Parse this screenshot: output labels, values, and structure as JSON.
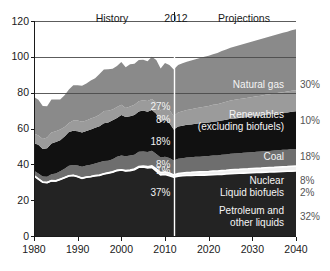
{
  "chart_data": {
    "type": "area",
    "title": "",
    "xlabel": "",
    "ylabel": "",
    "xlim": [
      1980,
      2040
    ],
    "ylim": [
      0,
      120
    ],
    "yticks": [
      0,
      20,
      40,
      60,
      80,
      100,
      120
    ],
    "xticks": [
      1980,
      1990,
      2000,
      2010,
      2020,
      2030,
      2040
    ],
    "grid": false,
    "legend_position": "inline-right",
    "stacked": true,
    "annotations": {
      "history_label": "History",
      "divider_year_label": "2012",
      "projections_label": "Projections",
      "divider_year": 2012
    },
    "x": [
      1980,
      1981,
      1982,
      1983,
      1984,
      1985,
      1986,
      1987,
      1988,
      1989,
      1990,
      1991,
      1992,
      1993,
      1994,
      1995,
      1996,
      1997,
      1998,
      1999,
      2000,
      2001,
      2002,
      2003,
      2004,
      2005,
      2006,
      2007,
      2008,
      2009,
      2010,
      2011,
      2012,
      2013,
      2014,
      2015,
      2016,
      2017,
      2018,
      2019,
      2020,
      2021,
      2022,
      2023,
      2024,
      2025,
      2026,
      2027,
      2028,
      2029,
      2030,
      2031,
      2032,
      2033,
      2034,
      2035,
      2036,
      2037,
      2038,
      2039,
      2040
    ],
    "series": [
      {
        "name": "Petroleum and other liquids",
        "color": "#232323",
        "label_2012": "37%",
        "label_2040": "32%",
        "values": [
          33.6,
          31.8,
          30.0,
          29.8,
          30.8,
          30.7,
          31.6,
          32.5,
          33.5,
          33.8,
          33.1,
          32.2,
          32.8,
          33.1,
          33.6,
          33.8,
          34.6,
          35.1,
          35.6,
          36.5,
          36.8,
          36.3,
          36.5,
          37.0,
          38.4,
          38.5,
          38.0,
          38.3,
          36.2,
          34.1,
          34.3,
          33.6,
          32.8,
          33.4,
          33.6,
          33.8,
          33.8,
          33.9,
          34.0,
          34.0,
          34.1,
          34.2,
          34.3,
          34.4,
          34.6,
          34.8,
          34.9,
          35.0,
          35.1,
          35.2,
          35.3,
          35.4,
          35.5,
          35.6,
          35.7,
          35.8,
          35.9,
          36.0,
          36.1,
          36.2,
          36.3
        ]
      },
      {
        "name": "Liquid biofuels",
        "color": "#f0f0f0",
        "label_2012": "1%",
        "label_2040": "2%",
        "values": [
          0.1,
          0.1,
          0.1,
          0.1,
          0.1,
          0.1,
          0.1,
          0.1,
          0.1,
          0.1,
          0.1,
          0.1,
          0.1,
          0.1,
          0.1,
          0.2,
          0.1,
          0.2,
          0.2,
          0.2,
          0.2,
          0.2,
          0.3,
          0.4,
          0.4,
          0.5,
          0.7,
          0.9,
          1.2,
          1.3,
          1.5,
          1.6,
          1.2,
          1.4,
          1.5,
          1.6,
          1.7,
          1.8,
          1.8,
          1.9,
          1.9,
          2.0,
          2.0,
          2.1,
          2.1,
          2.2,
          2.2,
          2.2,
          2.3,
          2.3,
          2.4,
          2.4,
          2.4,
          2.5,
          2.5,
          2.5,
          2.6,
          2.6,
          2.6,
          2.7,
          2.7
        ]
      },
      {
        "name": "Nuclear",
        "color": "#6e6e6e",
        "label_2012": "8%",
        "label_2040": "8%",
        "values": [
          2.7,
          3.0,
          3.1,
          3.2,
          3.6,
          4.1,
          4.4,
          4.9,
          5.6,
          5.7,
          6.1,
          6.4,
          6.5,
          6.5,
          6.8,
          7.1,
          7.2,
          6.7,
          7.1,
          7.6,
          7.9,
          8.0,
          8.1,
          7.9,
          8.2,
          8.2,
          8.2,
          8.4,
          8.4,
          8.4,
          8.4,
          8.3,
          8.1,
          8.3,
          8.3,
          8.4,
          8.4,
          8.5,
          8.5,
          8.6,
          8.6,
          8.7,
          8.7,
          8.8,
          8.8,
          8.9,
          8.9,
          9.0,
          9.0,
          9.1,
          9.1,
          9.2,
          9.2,
          9.3,
          9.3,
          9.4,
          9.4,
          9.5,
          9.5,
          9.6,
          9.6
        ]
      },
      {
        "name": "Coal",
        "color": "#111111",
        "label_2012": "18%",
        "label_2040": "18%",
        "values": [
          15.4,
          16.0,
          15.3,
          15.9,
          17.1,
          17.5,
          17.3,
          18.0,
          18.8,
          19.1,
          19.2,
          19.0,
          19.2,
          19.8,
          19.9,
          20.1,
          21.0,
          21.4,
          21.7,
          21.6,
          22.6,
          21.9,
          21.9,
          22.3,
          22.5,
          22.8,
          22.4,
          22.7,
          22.4,
          19.7,
          20.8,
          19.6,
          17.3,
          18.0,
          18.2,
          18.3,
          18.4,
          18.5,
          18.6,
          18.7,
          18.8,
          18.9,
          19.0,
          19.2,
          19.4,
          19.5,
          19.6,
          19.7,
          19.8,
          19.9,
          20.0,
          20.1,
          20.2,
          20.3,
          20.4,
          20.5,
          20.6,
          20.7,
          20.8,
          20.9,
          21.0
        ]
      },
      {
        "name": "Renewables (excluding biofuels)",
        "color": "#9b9b9b",
        "label_2012": "8%",
        "label_2040": "10%",
        "values": [
          5.4,
          5.2,
          5.6,
          6.0,
          6.1,
          6.0,
          6.1,
          5.4,
          5.1,
          5.7,
          6.0,
          6.1,
          5.8,
          6.1,
          6.0,
          6.5,
          6.9,
          6.5,
          6.0,
          6.1,
          5.8,
          5.0,
          5.5,
          5.6,
          5.7,
          5.8,
          6.0,
          6.1,
          6.3,
          6.6,
          6.8,
          7.4,
          7.4,
          7.8,
          8.0,
          8.2,
          8.4,
          8.6,
          8.8,
          9.0,
          9.2,
          9.4,
          9.6,
          9.8,
          10.0,
          10.2,
          10.4,
          10.5,
          10.6,
          10.7,
          10.8,
          10.9,
          11.0,
          11.1,
          11.2,
          11.3,
          11.4,
          11.5,
          11.6,
          11.7,
          11.8
        ]
      },
      {
        "name": "Natural gas",
        "color": "#8a8a8a",
        "label_2012": "27%",
        "label_2040": "30%",
        "values": [
          20.4,
          19.9,
          18.5,
          17.4,
          18.5,
          17.8,
          16.7,
          17.7,
          18.6,
          19.7,
          19.6,
          20.1,
          20.7,
          21.2,
          21.7,
          22.7,
          23.1,
          23.2,
          22.8,
          22.9,
          23.8,
          22.8,
          23.6,
          22.9,
          23.0,
          22.6,
          22.2,
          23.6,
          23.8,
          23.4,
          24.7,
          24.9,
          26.1,
          26.6,
          26.8,
          27.0,
          27.2,
          27.4,
          27.6,
          27.8,
          28.0,
          28.3,
          28.6,
          28.9,
          29.2,
          29.5,
          29.8,
          30.1,
          30.4,
          30.7,
          31.0,
          31.3,
          31.6,
          31.9,
          32.2,
          32.5,
          32.8,
          33.1,
          33.4,
          33.7,
          34.0
        ]
      }
    ]
  },
  "right_labels": [
    {
      "name": "Natural gas",
      "pct": "30%",
      "line2": ""
    },
    {
      "name": "Renewables",
      "pct": "10%",
      "line2": "(excluding biofuels)"
    },
    {
      "name": "Coal",
      "pct": "18%",
      "line2": ""
    },
    {
      "name": "Nuclear",
      "pct": "8%",
      "line2": ""
    },
    {
      "name": "Liquid biofuels",
      "pct": "2%",
      "line2": ""
    },
    {
      "name": "Petroleum and",
      "pct": "32%",
      "line2": "other liquids"
    }
  ],
  "inline_labels": [
    {
      "pct": "27%"
    },
    {
      "pct": "8%"
    },
    {
      "pct": "18%"
    },
    {
      "pct": "8%"
    },
    {
      "pct": "1%"
    },
    {
      "pct": "37%"
    }
  ],
  "axes": {
    "y_ticks": [
      "120",
      "100",
      "80",
      "60",
      "40",
      "20",
      "0"
    ],
    "x_ticks": [
      "1980",
      "1990",
      "2000",
      "2010",
      "2020",
      "2030",
      "2040"
    ]
  },
  "header": {
    "history": "History",
    "divider_year": "2012",
    "projections": "Projections"
  }
}
